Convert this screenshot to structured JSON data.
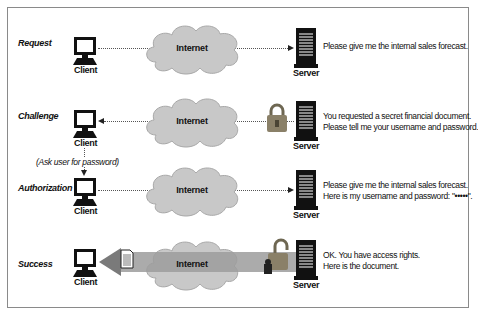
{
  "diagram": {
    "colors": {
      "cloud": "#c8c8c8",
      "cloud_edge": "#a8a8a8",
      "arrow": "#9c9c9c",
      "arrow_head": "#7a7a7a",
      "lock": "#8a8068",
      "icon": "#111111"
    },
    "rows": [
      {
        "step": "Request",
        "client_label": "Client",
        "cloud_label": "Internet",
        "server_label": "Server",
        "direction": "client-to-server",
        "message_lines": [
          "Please give me the internal sales forecast."
        ]
      },
      {
        "step": "Challenge",
        "client_label": "Client",
        "cloud_label": "Internet",
        "server_label": "Server",
        "direction": "server-to-client",
        "message_lines": [
          "You requested a secret financial document.",
          "Please tell me your username and password."
        ]
      },
      {
        "step": "Authorization",
        "client_label": "Client",
        "cloud_label": "Internet",
        "server_label": "Server",
        "direction": "client-to-server",
        "message_lines": [
          "Please give me the internal sales forecast.",
          "Here is my username and password: \"•••••\"."
        ]
      },
      {
        "step": "Success",
        "client_label": "Client",
        "cloud_label": "Internet",
        "server_label": "Server",
        "direction": "server-to-client",
        "message_lines": [
          "OK. You have access rights.",
          "Here is the document."
        ]
      }
    ],
    "note": "(Ask user for password)"
  }
}
